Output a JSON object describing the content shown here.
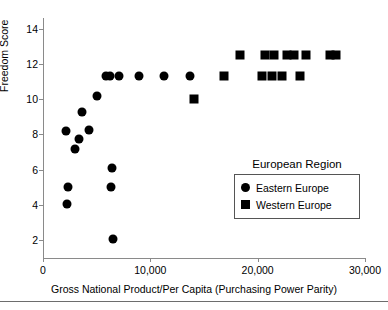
{
  "chart_data": {
    "type": "scatter",
    "title": "",
    "xlabel": "Gross National Product/Per Capita (Purchasing Power Parity)",
    "ylabel": "Freedom Score",
    "xlim": [
      0,
      30000
    ],
    "ylim": [
      1,
      14.6
    ],
    "xticks": [
      0,
      10000,
      20000,
      30000
    ],
    "xticklabels": [
      "0",
      "10,000",
      "20,000",
      "30,000"
    ],
    "yticks": [
      2,
      4,
      6,
      8,
      10,
      12,
      14
    ],
    "yticklabels": [
      "2",
      "4",
      "6",
      "8",
      "10",
      "12",
      "14"
    ],
    "grid": false,
    "legend_position": "inside-lower-right",
    "legend_title": "European Region",
    "series": [
      {
        "name": "Eastern Europe",
        "marker": "circle",
        "color": "#000000",
        "points": [
          [
            2150,
            8.2
          ],
          [
            2950,
            7.15
          ],
          [
            2350,
            5.0
          ],
          [
            2200,
            4.05
          ],
          [
            4250,
            8.25
          ],
          [
            3650,
            9.3
          ],
          [
            3350,
            7.75
          ],
          [
            5050,
            10.2
          ],
          [
            5850,
            11.3
          ],
          [
            6250,
            11.3
          ],
          [
            7100,
            11.3
          ],
          [
            6400,
            6.1
          ],
          [
            6300,
            5.0
          ],
          [
            6500,
            2.1
          ],
          [
            8900,
            11.3
          ],
          [
            11300,
            11.3
          ],
          [
            13700,
            11.3
          ]
        ]
      },
      {
        "name": "Western Europe",
        "marker": "square",
        "color": "#000000",
        "points": [
          [
            14050,
            10.0
          ],
          [
            16900,
            11.3
          ],
          [
            18350,
            12.5
          ],
          [
            20700,
            12.5
          ],
          [
            21550,
            12.5
          ],
          [
            22750,
            12.5
          ],
          [
            23350,
            12.5
          ],
          [
            24500,
            12.5
          ],
          [
            26700,
            12.5
          ],
          [
            27300,
            12.5
          ],
          [
            20400,
            11.3
          ],
          [
            21350,
            11.3
          ],
          [
            22250,
            11.3
          ],
          [
            23900,
            11.3
          ]
        ]
      }
    ]
  },
  "legend": {
    "title": "European Region",
    "entries": [
      {
        "label": "Eastern Europe",
        "marker": "circle"
      },
      {
        "label": "Western Europe",
        "marker": "square"
      }
    ]
  }
}
